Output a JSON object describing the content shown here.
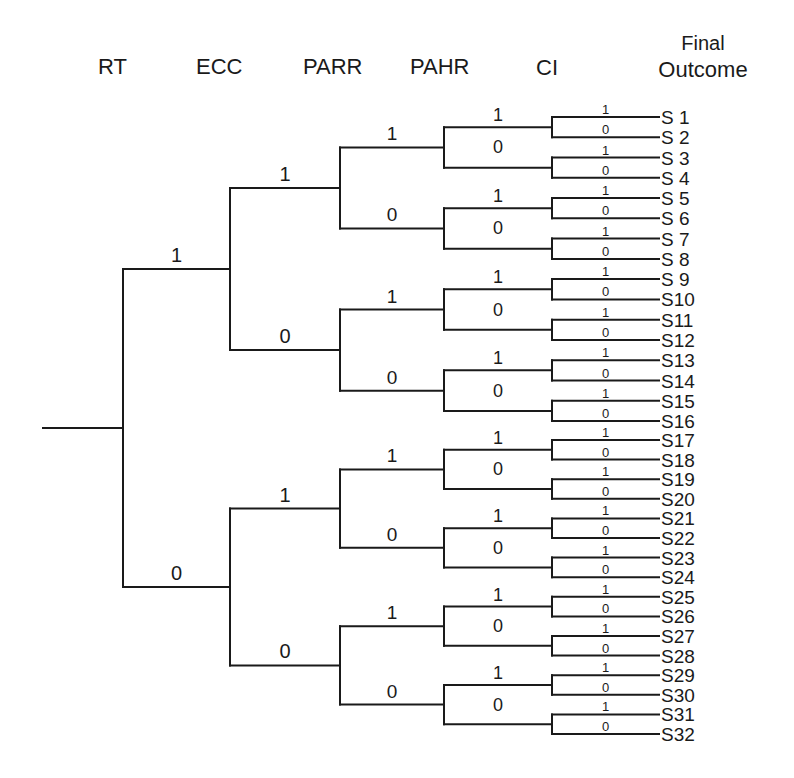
{
  "headers": {
    "rt": "RT",
    "ecc": "ECC",
    "parr": "PARR",
    "pahr": "PAHR",
    "ci": "CI",
    "final_line1": "Final",
    "final_line2": "Outcome"
  },
  "tree": {
    "levels": [
      "RT",
      "ECC",
      "PARR",
      "PAHR",
      "CI"
    ],
    "branch_labels": [
      "1",
      "0"
    ],
    "leaves": [
      "S 1",
      "S 2",
      "S 3",
      "S 4",
      "S 5",
      "S 6",
      "S 7",
      "S 8",
      "S 9",
      "S10",
      "S11",
      "S12",
      "S13",
      "S14",
      "S15",
      "S16",
      "S17",
      "S18",
      "S19",
      "S20",
      "S21",
      "S22",
      "S23",
      "S24",
      "S25",
      "S26",
      "S27",
      "S28",
      "S29",
      "S30",
      "S31",
      "S32"
    ]
  },
  "chart_data": {
    "type": "tree",
    "title": "",
    "column_headers": [
      "RT",
      "ECC",
      "PARR",
      "PAHR",
      "CI",
      "Final Outcome"
    ],
    "binary_split_order": "1 above, 0 below at every level",
    "depth": 5,
    "outcomes": [
      {
        "id": "S 1",
        "RT": 1,
        "ECC": 1,
        "PARR": 1,
        "PAHR": 1,
        "CI": 1
      },
      {
        "id": "S 2",
        "RT": 1,
        "ECC": 1,
        "PARR": 1,
        "PAHR": 1,
        "CI": 0
      },
      {
        "id": "S 3",
        "RT": 1,
        "ECC": 1,
        "PARR": 1,
        "PAHR": 0,
        "CI": 1
      },
      {
        "id": "S 4",
        "RT": 1,
        "ECC": 1,
        "PARR": 1,
        "PAHR": 0,
        "CI": 0
      },
      {
        "id": "S 5",
        "RT": 1,
        "ECC": 1,
        "PARR": 0,
        "PAHR": 1,
        "CI": 1
      },
      {
        "id": "S 6",
        "RT": 1,
        "ECC": 1,
        "PARR": 0,
        "PAHR": 1,
        "CI": 0
      },
      {
        "id": "S 7",
        "RT": 1,
        "ECC": 1,
        "PARR": 0,
        "PAHR": 0,
        "CI": 1
      },
      {
        "id": "S 8",
        "RT": 1,
        "ECC": 1,
        "PARR": 0,
        "PAHR": 0,
        "CI": 0
      },
      {
        "id": "S 9",
        "RT": 1,
        "ECC": 0,
        "PARR": 1,
        "PAHR": 1,
        "CI": 1
      },
      {
        "id": "S10",
        "RT": 1,
        "ECC": 0,
        "PARR": 1,
        "PAHR": 1,
        "CI": 0
      },
      {
        "id": "S11",
        "RT": 1,
        "ECC": 0,
        "PARR": 1,
        "PAHR": 0,
        "CI": 1
      },
      {
        "id": "S12",
        "RT": 1,
        "ECC": 0,
        "PARR": 1,
        "PAHR": 0,
        "CI": 0
      },
      {
        "id": "S13",
        "RT": 1,
        "ECC": 0,
        "PARR": 0,
        "PAHR": 1,
        "CI": 1
      },
      {
        "id": "S14",
        "RT": 1,
        "ECC": 0,
        "PARR": 0,
        "PAHR": 1,
        "CI": 0
      },
      {
        "id": "S15",
        "RT": 1,
        "ECC": 0,
        "PARR": 0,
        "PAHR": 0,
        "CI": 1
      },
      {
        "id": "S16",
        "RT": 1,
        "ECC": 0,
        "PARR": 0,
        "PAHR": 0,
        "CI": 0
      },
      {
        "id": "S17",
        "RT": 0,
        "ECC": 1,
        "PARR": 1,
        "PAHR": 1,
        "CI": 1
      },
      {
        "id": "S18",
        "RT": 0,
        "ECC": 1,
        "PARR": 1,
        "PAHR": 1,
        "CI": 0
      },
      {
        "id": "S19",
        "RT": 0,
        "ECC": 1,
        "PARR": 1,
        "PAHR": 0,
        "CI": 1
      },
      {
        "id": "S20",
        "RT": 0,
        "ECC": 1,
        "PARR": 1,
        "PAHR": 0,
        "CI": 0
      },
      {
        "id": "S21",
        "RT": 0,
        "ECC": 1,
        "PARR": 0,
        "PAHR": 1,
        "CI": 1
      },
      {
        "id": "S22",
        "RT": 0,
        "ECC": 1,
        "PARR": 0,
        "PAHR": 1,
        "CI": 0
      },
      {
        "id": "S23",
        "RT": 0,
        "ECC": 1,
        "PARR": 0,
        "PAHR": 0,
        "CI": 1
      },
      {
        "id": "S24",
        "RT": 0,
        "ECC": 1,
        "PARR": 0,
        "PAHR": 0,
        "CI": 0
      },
      {
        "id": "S25",
        "RT": 0,
        "ECC": 0,
        "PARR": 1,
        "PAHR": 1,
        "CI": 1
      },
      {
        "id": "S26",
        "RT": 0,
        "ECC": 0,
        "PARR": 1,
        "PAHR": 1,
        "CI": 0
      },
      {
        "id": "S27",
        "RT": 0,
        "ECC": 0,
        "PARR": 1,
        "PAHR": 0,
        "CI": 1
      },
      {
        "id": "S28",
        "RT": 0,
        "ECC": 0,
        "PARR": 1,
        "PAHR": 0,
        "CI": 0
      },
      {
        "id": "S29",
        "RT": 0,
        "ECC": 0,
        "PARR": 0,
        "PAHR": 1,
        "CI": 1
      },
      {
        "id": "S30",
        "RT": 0,
        "ECC": 0,
        "PARR": 0,
        "PAHR": 1,
        "CI": 0
      },
      {
        "id": "S31",
        "RT": 0,
        "ECC": 0,
        "PARR": 0,
        "PAHR": 0,
        "CI": 1
      },
      {
        "id": "S32",
        "RT": 0,
        "ECC": 0,
        "PARR": 0,
        "PAHR": 0,
        "CI": 0
      }
    ],
    "layout": {
      "root_x": 43,
      "node_x": [
        123,
        230,
        340,
        444,
        552
      ],
      "leaf_end_x": 659,
      "leaf_label_x": 661,
      "leaf_y": [
        117,
        137.3,
        157.5,
        177.8,
        198.1,
        218.3,
        238.6,
        258.9,
        279.1,
        299.4,
        319.7,
        340,
        360.2,
        380.5,
        400.8,
        421,
        440,
        459.6,
        479.2,
        498.8,
        518.4,
        538,
        557.6,
        577.2,
        596.8,
        616.4,
        636,
        655.6,
        675.2,
        694.8,
        714.4,
        734
      ],
      "label_font_px": [
        20,
        20,
        19,
        18,
        13
      ]
    }
  }
}
